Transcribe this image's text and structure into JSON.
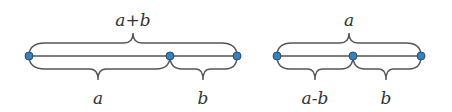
{
  "diagrams": [
    {
      "name": "sum-diagram",
      "top_label": "a+b",
      "bottom_labels": [
        "a",
        "b"
      ]
    },
    {
      "name": "difference-diagram",
      "top_label": "a",
      "bottom_labels": [
        "a-b",
        "b"
      ]
    }
  ],
  "colors": {
    "point": "#3a7fb8",
    "line": "#555555",
    "text": "#333333"
  }
}
